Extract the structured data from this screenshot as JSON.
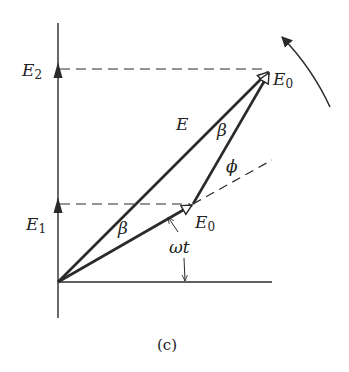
{
  "figure": {
    "caption": "(c)",
    "colors": {
      "line": "#2a2a2a",
      "background": "#ffffff"
    }
  },
  "axis_labels": {
    "e2": {
      "main": "E",
      "sub": "2"
    },
    "e1": {
      "main": "E",
      "sub": "1"
    }
  },
  "vector_labels": {
    "resultant": "E",
    "e0_upper": {
      "main": "E",
      "sub": "0"
    },
    "e0_lower": {
      "main": "E",
      "sub": "0"
    }
  },
  "angle_labels": {
    "beta_upper": "β",
    "beta_lower": "β",
    "phi": "ϕ",
    "omega_t": "ωt"
  },
  "icons": {
    "rotation_arrow": "counterclockwise-arrow-icon",
    "axis_arrow": "up-arrow-icon"
  }
}
